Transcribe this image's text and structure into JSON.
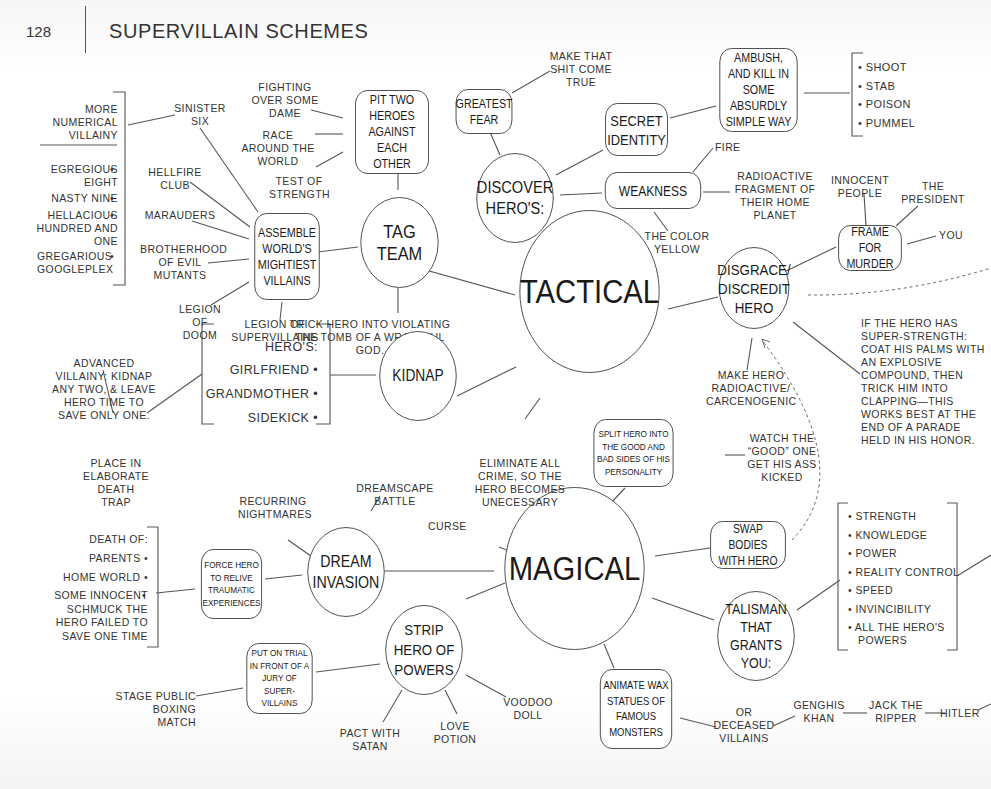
{
  "header": {
    "page_number": "128",
    "title": "SUPERVILLAIN SCHEMES"
  },
  "hubs": {
    "tactical": "TACTICAL",
    "magical": "MAGICAL"
  },
  "tactical": {
    "tag_team": {
      "label": "TAG TEAM",
      "note": "TRICK HERO INTO VIOLATING THE TOMB OF A WRATHFUL GOD."
    },
    "pit_two_heroes": {
      "label": "PIT TWO HEROES AGAINST EACH OTHER",
      "options": [
        "FIGHTING OVER SOME DAME",
        "RACE AROUND THE WORLD",
        "TEST OF STRENGTH"
      ]
    },
    "assemble": {
      "label": "ASSEMBLE WORLD'S MIGHTIEST VILLAINS",
      "teams": [
        "SINISTER SIX",
        "HELLFIRE CLUB",
        "MARAUDERS",
        "BROTHERHOOD OF EVIL MUTANTS",
        "LEGION OF DOOM",
        "LEGION OF SUPERVILLAINS"
      ],
      "more_label": "MORE NUMERICAL VILLAINY",
      "numerical": [
        "EGREGIOUS EIGHT",
        "NASTY NINE",
        "HELLACIOUS HUNDRED AND ONE",
        "GREGARIOUS GOOGLEPLEX"
      ]
    },
    "discover": {
      "label": "DISCOVER HERO'S:",
      "greatest_fear": {
        "label": "GREATEST FEAR",
        "note": "MAKE THAT SHIT COME TRUE"
      },
      "secret_identity": {
        "label": "SECRET IDENTITY"
      },
      "ambush": {
        "label": "AMBUSH, AND KILL IN SOME ABSURDLY SIMPLE WAY",
        "methods": [
          "SHOOT",
          "STAB",
          "POISON",
          "PUMMEL"
        ]
      },
      "weakness": {
        "label": "WEAKNESS",
        "options": [
          "FIRE",
          "RADIOACTIVE FRAGMENT OF THEIR HOME PLANET",
          "THE COLOR YELLOW"
        ]
      }
    },
    "disgrace": {
      "label": "DISGRACE/ DISCREDIT HERO",
      "frame": {
        "label": "FRAME FOR MURDER",
        "targets": [
          "INNOCENT PEOPLE",
          "THE PRESIDENT",
          "YOU"
        ]
      },
      "radioactive": "MAKE HERO RADIOACTIVE/ CARCENOGENIC",
      "super_strength": "IF THE HERO HAS SUPER-STRENGTH: COAT HIS PALMS WITH AN EXPLOSIVE COMPOUND, THEN TRICK HIM INTO CLAPPING—THIS WORKS BEST AT THE END OF A PARADE HELD IN HIS HONOR."
    },
    "kidnap": {
      "label": "KIDNAP",
      "list_header": "HERO'S:",
      "targets": [
        "GIRLFRIEND",
        "GRANDMOTHER",
        "SIDEKICK"
      ],
      "advanced": "ADVANCED VILLAINY: KIDNAP ANY TWO, & LEAVE HERO TIME TO SAVE ONLY ONE.",
      "death_trap": "PLACE IN ELABORATE DEATH TRAP"
    },
    "eliminate": "ELIMINATE ALL CRIME, SO THE HERO BECOMES UNECESSARY"
  },
  "magical": {
    "curse": "CURSE",
    "split": {
      "label": "SPLIT HERO INTO THE GOOD AND BAD SIDES OF HIS PERSONALITY",
      "note": "WATCH THE “GOOD” ONE GET HIS ASS KICKED"
    },
    "swap": {
      "label": "SWAP BODIES WITH HERO"
    },
    "talisman": {
      "label": "TALISMAN THAT GRANTS YOU:",
      "powers": [
        "STRENGTH",
        "KNOWLEDGE",
        "POWER",
        "REALITY CONTROL",
        "SPEED",
        "INVINCIBILITY",
        "ALL THE HERO'S POWERS"
      ]
    },
    "wax": {
      "label": "ANIMATE WAX STATUES OF FAMOUS MONSTERS",
      "or_label": "OR DECEASED VILLAINS",
      "villains": [
        "GENGHIS KHAN",
        "JACK THE RIPPER",
        "HITLER"
      ]
    },
    "dream": {
      "label": "DREAM INVASION",
      "options": [
        "RECURRING NIGHTMARES",
        "DREAMSCAPE BATTLE"
      ],
      "relive": {
        "label": "FORCE HERO TO RELIVE TRAUMATIC EXPERIENCES",
        "header": "DEATH OF:",
        "items": [
          "PARENTS",
          "HOME WORLD",
          "SOME INNOCENT SCHMUCK THE HERO FAILED TO SAVE ONE TIME"
        ]
      }
    },
    "strip": {
      "label": "STRIP HERO OF POWERS",
      "methods": [
        "PACT WITH SATAN",
        "LOVE POTION",
        "VOODOO DOLL"
      ],
      "trial": {
        "label": "PUT ON TRIAL IN FRONT OF A JURY OF SUPER-VILLAINS",
        "note": "STAGE PUBLIC BOXING MATCH"
      }
    }
  }
}
